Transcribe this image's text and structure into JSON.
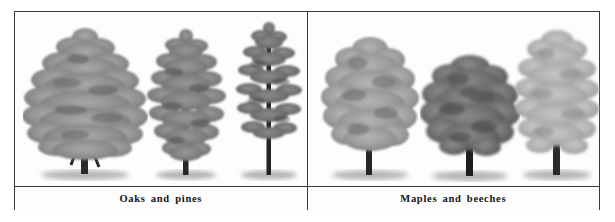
{
  "figure": {
    "type": "illustration-plate",
    "style": "grayscale-botanical-drawing",
    "background_color": "#fdfdfd",
    "border_color": "#3a3a3a",
    "panels": [
      {
        "id": "left",
        "caption": "Oaks and pines",
        "tree_count": 3,
        "trees": [
          {
            "name": "broad-conical-pine",
            "form": "conical-layered",
            "foliage_tone": "#8d8d8d",
            "trunk_tone": "#2a2a2a",
            "height_ratio": 0.88,
            "width_ratio": 0.95
          },
          {
            "name": "narrow-spire-pine",
            "form": "narrow-conical",
            "foliage_tone": "#7e7e7e",
            "trunk_tone": "#2a2a2a",
            "height_ratio": 0.84,
            "width_ratio": 0.62
          },
          {
            "name": "tall-sparse-spruce",
            "form": "tall-open-whorled",
            "foliage_tone": "#6f6f6f",
            "trunk_tone": "#242424",
            "height_ratio": 0.92,
            "width_ratio": 0.55
          }
        ]
      },
      {
        "id": "right",
        "caption": "Maples and beeches",
        "tree_count": 3,
        "trees": [
          {
            "name": "upright-oval-maple",
            "form": "upright-oval",
            "foliage_tone": "#9a9a9a",
            "trunk_tone": "#262626",
            "height_ratio": 0.82,
            "width_ratio": 0.72
          },
          {
            "name": "dense-round-beech",
            "form": "rounded-dense",
            "foliage_tone": "#6e6e6e",
            "trunk_tone": "#1f1f1f",
            "height_ratio": 0.68,
            "width_ratio": 0.78
          },
          {
            "name": "feathery-open-maple",
            "form": "open-feathery",
            "foliage_tone": "#b0b0b0",
            "trunk_tone": "#2b2b2b",
            "height_ratio": 0.86,
            "width_ratio": 0.8
          }
        ]
      }
    ]
  }
}
